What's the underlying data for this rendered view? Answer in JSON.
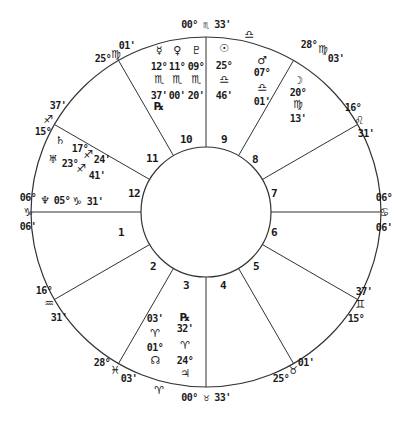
{
  "chart": {
    "center": [
      206,
      212
    ],
    "outer_radius": 175,
    "inner_radius": 65,
    "line_color": "#333333",
    "text_color": "#1a1a1a",
    "cusp_angles_deg": [
      180,
      210,
      240,
      270,
      300,
      330,
      0,
      30,
      60,
      90,
      120,
      150
    ]
  },
  "house_numbers": [
    {
      "n": "1",
      "x": 121,
      "y": 232
    },
    {
      "n": "2",
      "x": 153,
      "y": 266
    },
    {
      "n": "3",
      "x": 186,
      "y": 285
    },
    {
      "n": "4",
      "x": 223,
      "y": 285
    },
    {
      "n": "5",
      "x": 256,
      "y": 266
    },
    {
      "n": "6",
      "x": 274,
      "y": 232
    },
    {
      "n": "7",
      "x": 274,
      "y": 193
    },
    {
      "n": "8",
      "x": 255,
      "y": 159
    },
    {
      "n": "9",
      "x": 224,
      "y": 139
    },
    {
      "n": "10",
      "x": 186,
      "y": 139
    },
    {
      "n": "11",
      "x": 152,
      "y": 158
    },
    {
      "n": "12",
      "x": 134,
      "y": 193
    }
  ],
  "cusp_labels": [
    {
      "id": "mc",
      "text": "00° ♏ 33'",
      "x": 206,
      "y": 24
    },
    {
      "id": "c11",
      "deg": "25°",
      "sign": "♍",
      "min": "01'",
      "deg_pos": [
        103,
        58
      ],
      "sign_pos": [
        116,
        54
      ],
      "min_pos": [
        127,
        45
      ]
    },
    {
      "id": "c12",
      "deg": "15°",
      "sign": "♐",
      "min": "37'",
      "deg_pos": [
        43,
        131
      ],
      "sign_pos": [
        48,
        119
      ],
      "min_pos": [
        58,
        105
      ]
    },
    {
      "id": "asc",
      "deg": "06°",
      "sign": "♑",
      "min": "06'",
      "deg_pos": [
        28,
        197
      ],
      "sign_pos": [
        28,
        212
      ],
      "min_pos": [
        28,
        226
      ]
    },
    {
      "id": "c2",
      "deg": "16°",
      "sign": "♒",
      "min": "31'",
      "deg_pos": [
        44,
        290
      ],
      "sign_pos": [
        49,
        303
      ],
      "min_pos": [
        59,
        317
      ]
    },
    {
      "id": "c3",
      "deg": "28°",
      "sign": "♓",
      "min": "03'",
      "deg_pos": [
        102,
        362
      ],
      "sign_pos": [
        115,
        370
      ],
      "min_pos": [
        129,
        378
      ]
    },
    {
      "id": "ic",
      "text": "00° ♉ 33'",
      "x": 206,
      "y": 397
    },
    {
      "id": "c5",
      "deg": "25°",
      "sign": "♉",
      "min": "01'",
      "deg_pos": [
        281,
        378
      ],
      "sign_pos": [
        293,
        370
      ],
      "min_pos": [
        306,
        362
      ]
    },
    {
      "id": "c6",
      "deg": "15°",
      "sign": "♊",
      "min": "37'",
      "deg_pos": [
        356,
        318
      ],
      "sign_pos": [
        360,
        304
      ],
      "min_pos": [
        364,
        291
      ]
    },
    {
      "id": "dsc",
      "deg": "06°",
      "sign": "♋",
      "min": "06'",
      "deg_pos": [
        384,
        197
      ],
      "sign_pos": [
        384,
        212
      ],
      "min_pos": [
        384,
        227
      ]
    },
    {
      "id": "c8",
      "deg": "16°",
      "sign": "♌",
      "min": "31'",
      "deg_pos": [
        353,
        107
      ],
      "sign_pos": [
        359,
        120
      ],
      "min_pos": [
        366,
        133
      ]
    },
    {
      "id": "c9",
      "deg": "28°",
      "sign": "♍",
      "min": "03'",
      "deg_pos": [
        309,
        44
      ],
      "sign_pos": [
        323,
        49
      ],
      "min_pos": [
        336,
        58
      ]
    }
  ],
  "planets": [
    {
      "name": "Mercury",
      "glyph": "☿",
      "deg": "12°",
      "sign": "♏",
      "min": "37'",
      "retro": "℞",
      "col_x": 159,
      "glyph_y": 50,
      "deg_y": 66,
      "sign_y": 79,
      "min_y": 95,
      "retro_y": 106
    },
    {
      "name": "Venus",
      "glyph": "♀",
      "deg": "11°",
      "sign": "♏",
      "min": "00'",
      "retro": "",
      "col_x": 177,
      "glyph_y": 50,
      "deg_y": 66,
      "sign_y": 79,
      "min_y": 95,
      "retro_y": 0
    },
    {
      "name": "Pluto",
      "glyph": "♇",
      "deg": "09°",
      "sign": "♏",
      "min": "20'",
      "retro": "",
      "col_x": 196,
      "glyph_y": 50,
      "deg_y": 66,
      "sign_y": 79,
      "min_y": 95,
      "retro_y": 0
    },
    {
      "name": "Sun",
      "glyph": "☉",
      "deg": "25°",
      "sign": "♎",
      "min": "46'",
      "retro": "",
      "col_x": 224,
      "glyph_y": 48,
      "deg_y": 65,
      "sign_y": 79,
      "min_y": 95,
      "retro_y": 0
    },
    {
      "name": "Mars",
      "glyph": "♂",
      "deg": "07°",
      "sign": "♎",
      "min": "01'",
      "retro": "",
      "col_x": 262,
      "glyph_y": 60,
      "deg_y": 72,
      "sign_y": 87,
      "min_y": 101,
      "retro_y": 0
    },
    {
      "name": "Moon",
      "glyph": "☽",
      "deg": "20°",
      "sign": "♍",
      "min": "13'",
      "retro": "",
      "col_x": 298,
      "glyph_y": 80,
      "deg_y": 92,
      "sign_y": 104,
      "min_y": 118,
      "retro_y": 0
    },
    {
      "name": "Saturn",
      "glyph": "♄",
      "deg": "17°",
      "sign": "♐",
      "min": "24'",
      "x_glyph": 60,
      "y_glyph": 140,
      "x_deg": 80,
      "y_deg": 148,
      "x_sign": 88,
      "y_sign": 154,
      "x_min": 102,
      "y_min": 159
    },
    {
      "name": "Uranus",
      "glyph": "♅",
      "deg": "23°",
      "sign": "♐",
      "min": "41'",
      "x_glyph": 53,
      "y_glyph": 159,
      "x_deg": 70,
      "y_deg": 163,
      "x_sign": 81,
      "y_sign": 168,
      "x_min": 97,
      "y_min": 175
    },
    {
      "name": "Neptune",
      "glyph": "♆",
      "deg": "05°",
      "sign": "♑",
      "min": "31'",
      "x_glyph": 45,
      "y_glyph": 200,
      "x_deg": 62,
      "y_deg": 200,
      "x_sign": 77,
      "y_sign": 201,
      "x_min": 95,
      "y_min": 201
    },
    {
      "name": "Node",
      "glyph": "☊",
      "deg": "01°",
      "sign": "♈",
      "min": "03'",
      "col_x": 155,
      "glyph_y": 360,
      "deg_y": 347,
      "sign_y": 333,
      "min_y": 318,
      "retro_y": 0
    },
    {
      "name": "Jupiter",
      "glyph": "♃",
      "deg": "24°",
      "sign": "♈",
      "min": "32'",
      "retro": "℞",
      "col_x": 185,
      "glyph_y": 373,
      "deg_y": 360,
      "sign_y": 345,
      "min_y": 328,
      "retro_y": 317
    }
  ],
  "intercepted": [
    {
      "id": "libra-top",
      "glyph": "♎",
      "x": 249,
      "y": 34
    },
    {
      "id": "aries-bottom",
      "glyph": "♈",
      "x": 159,
      "y": 390
    }
  ]
}
